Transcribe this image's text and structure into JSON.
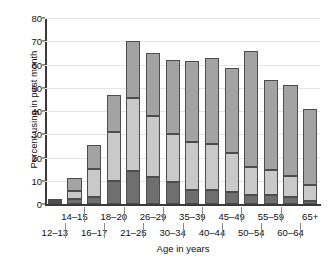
{
  "chart_data": {
    "type": "bar",
    "subtype": "stacked-bar",
    "title": "",
    "xlabel": "Age in years",
    "ylabel": "Percent using in past month",
    "ylim": [
      0,
      80
    ],
    "yticks": [
      0,
      10,
      20,
      30,
      40,
      50,
      60,
      70,
      80
    ],
    "ytick_labels": [
      "0",
      "10",
      "20",
      "30",
      "40",
      "50",
      "60",
      "70",
      "80"
    ],
    "grid": true,
    "legend": "none",
    "categories": [
      "12–13",
      "14–15",
      "16–17",
      "18–20",
      "21–25",
      "26–29",
      "30–34",
      "35–39",
      "40–44",
      "45–49",
      "50–54",
      "55–59",
      "60–64",
      "65+"
    ],
    "series": [
      {
        "name": "bottom-segment",
        "color": "#6f6f6f",
        "values": [
          0.5,
          2.0,
          3.0,
          10.0,
          14.0,
          11.5,
          9.5,
          6.0,
          6.0,
          5.0,
          4.0,
          4.0,
          3.0,
          1.5
        ]
      },
      {
        "name": "middle-segment",
        "color": "#c9c9c9",
        "values": [
          0.7,
          3.8,
          12.0,
          21.0,
          31.5,
          26.5,
          20.5,
          20.5,
          20.0,
          17.0,
          12.0,
          10.5,
          9.0,
          6.5
        ]
      },
      {
        "name": "top-segment",
        "color": "#a3a3a3",
        "values": [
          0.8,
          5.2,
          10.5,
          16.0,
          24.5,
          27.0,
          32.0,
          35.0,
          37.0,
          36.5,
          50.0,
          39.0,
          39.0,
          33.0
        ]
      }
    ],
    "totals": [
      2.0,
      11.0,
      25.5,
      47.0,
      70.0,
      65.0,
      62.0,
      61.5,
      63.0,
      58.5,
      66.0,
      53.5,
      51.0,
      41.0
    ]
  },
  "axis": {
    "y_title": "Percent using in past month",
    "x_title": "Age in years"
  },
  "colors": {
    "bottom": "#6f6f6f",
    "middle": "#c9c9c9",
    "top": "#a3a3a3",
    "outline": "#4d4d4d",
    "axis": "#3a3a3a",
    "grid": "#e6e6e6",
    "background": "#ffffff"
  }
}
